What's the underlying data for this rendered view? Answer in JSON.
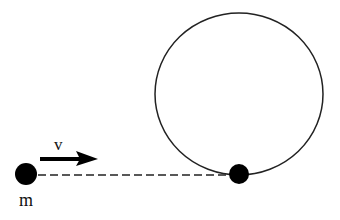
{
  "diagram": {
    "labels": {
      "mass": "m",
      "velocity": "v"
    },
    "elements": {
      "mass_ball": {
        "cx": 26,
        "cy": 174,
        "r": 11
      },
      "velocity_arrow": {
        "x1": 40,
        "y1": 159,
        "x2": 97,
        "y2": 159
      },
      "dashed_path": {
        "x1": 38,
        "y1": 175,
        "x2": 232,
        "y2": 175
      },
      "loop": {
        "cx": 239,
        "cy": 94,
        "rx": 84,
        "ry": 81
      },
      "loop_bottom_ball": {
        "cx": 239,
        "cy": 174,
        "r": 10
      }
    },
    "colors": {
      "ink": "#111111",
      "background": "#ffffff"
    }
  }
}
